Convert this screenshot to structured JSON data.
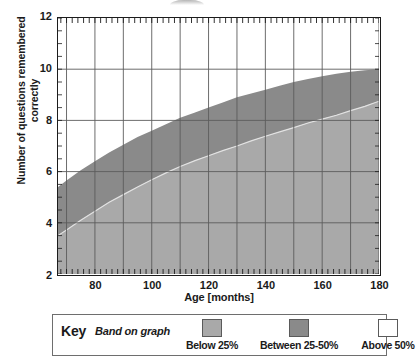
{
  "chart_data": {
    "type": "area",
    "title": "",
    "xlabel": "Age [months]",
    "ylabel": "Number of questions remembered correctly",
    "xlim": [
      67,
      180
    ],
    "ylim": [
      2,
      12
    ],
    "xticks": [
      80,
      100,
      120,
      140,
      160,
      180
    ],
    "yticks": [
      2,
      4,
      6,
      8,
      10,
      12
    ],
    "x_minor_tick_step": 2,
    "grid": true,
    "grid_x_step": 10,
    "grid_y_step": 2,
    "legend_position": "below-plot",
    "x": [
      67,
      70,
      75,
      80,
      85,
      90,
      95,
      100,
      105,
      110,
      115,
      120,
      125,
      130,
      135,
      140,
      145,
      150,
      155,
      160,
      165,
      170,
      175,
      180
    ],
    "series": [
      {
        "name": "50th centile boundary",
        "label": "Between 25-50%",
        "color": "#8a8a8a",
        "values": [
          5.4,
          5.65,
          6.05,
          6.4,
          6.75,
          7.05,
          7.35,
          7.6,
          7.85,
          8.1,
          8.3,
          8.5,
          8.7,
          8.9,
          9.05,
          9.2,
          9.35,
          9.5,
          9.62,
          9.72,
          9.82,
          9.9,
          9.96,
          10.0
        ]
      },
      {
        "name": "25th centile boundary",
        "label": "Below 25%",
        "color": "#a9a9a9",
        "values": [
          3.5,
          3.72,
          4.1,
          4.45,
          4.8,
          5.1,
          5.4,
          5.68,
          5.95,
          6.2,
          6.42,
          6.62,
          6.82,
          7.0,
          7.2,
          7.38,
          7.55,
          7.72,
          7.9,
          8.05,
          8.2,
          8.38,
          8.55,
          8.75
        ]
      }
    ],
    "bands": [
      {
        "name": "Below 25%",
        "from": "y-min",
        "to": "25th centile boundary",
        "color": "#a9a9a9"
      },
      {
        "name": "Between 25-50%",
        "from": "25th centile boundary",
        "to": "50th centile boundary",
        "color": "#8a8a8a"
      },
      {
        "name": "Above 50%",
        "from": "50th centile boundary",
        "to": "y-max",
        "color": "#ffffff"
      }
    ]
  },
  "axes": {
    "y_title": "Number of questions remembered correctly",
    "x_title": "Age [months]",
    "y_tick_labels": [
      "12",
      "10",
      "8",
      "6",
      "4",
      "2"
    ],
    "x_tick_labels": [
      "80",
      "100",
      "120",
      "140",
      "160",
      "180"
    ]
  },
  "key": {
    "title": "Key",
    "subtitle": "Band on graph",
    "entries": [
      {
        "caption": "Below 25%",
        "color": "#a9a9a9"
      },
      {
        "caption": "Between 25-50%",
        "color": "#8a8a8a"
      },
      {
        "caption": "Above 50%",
        "color": "#ffffff"
      }
    ]
  },
  "colors": {
    "band_below_25": "#a9a9a9",
    "band_25_50": "#8a8a8a",
    "band_above_50": "#ffffff",
    "grid": "#5c5c5c",
    "axis": "#1c1c1c"
  }
}
